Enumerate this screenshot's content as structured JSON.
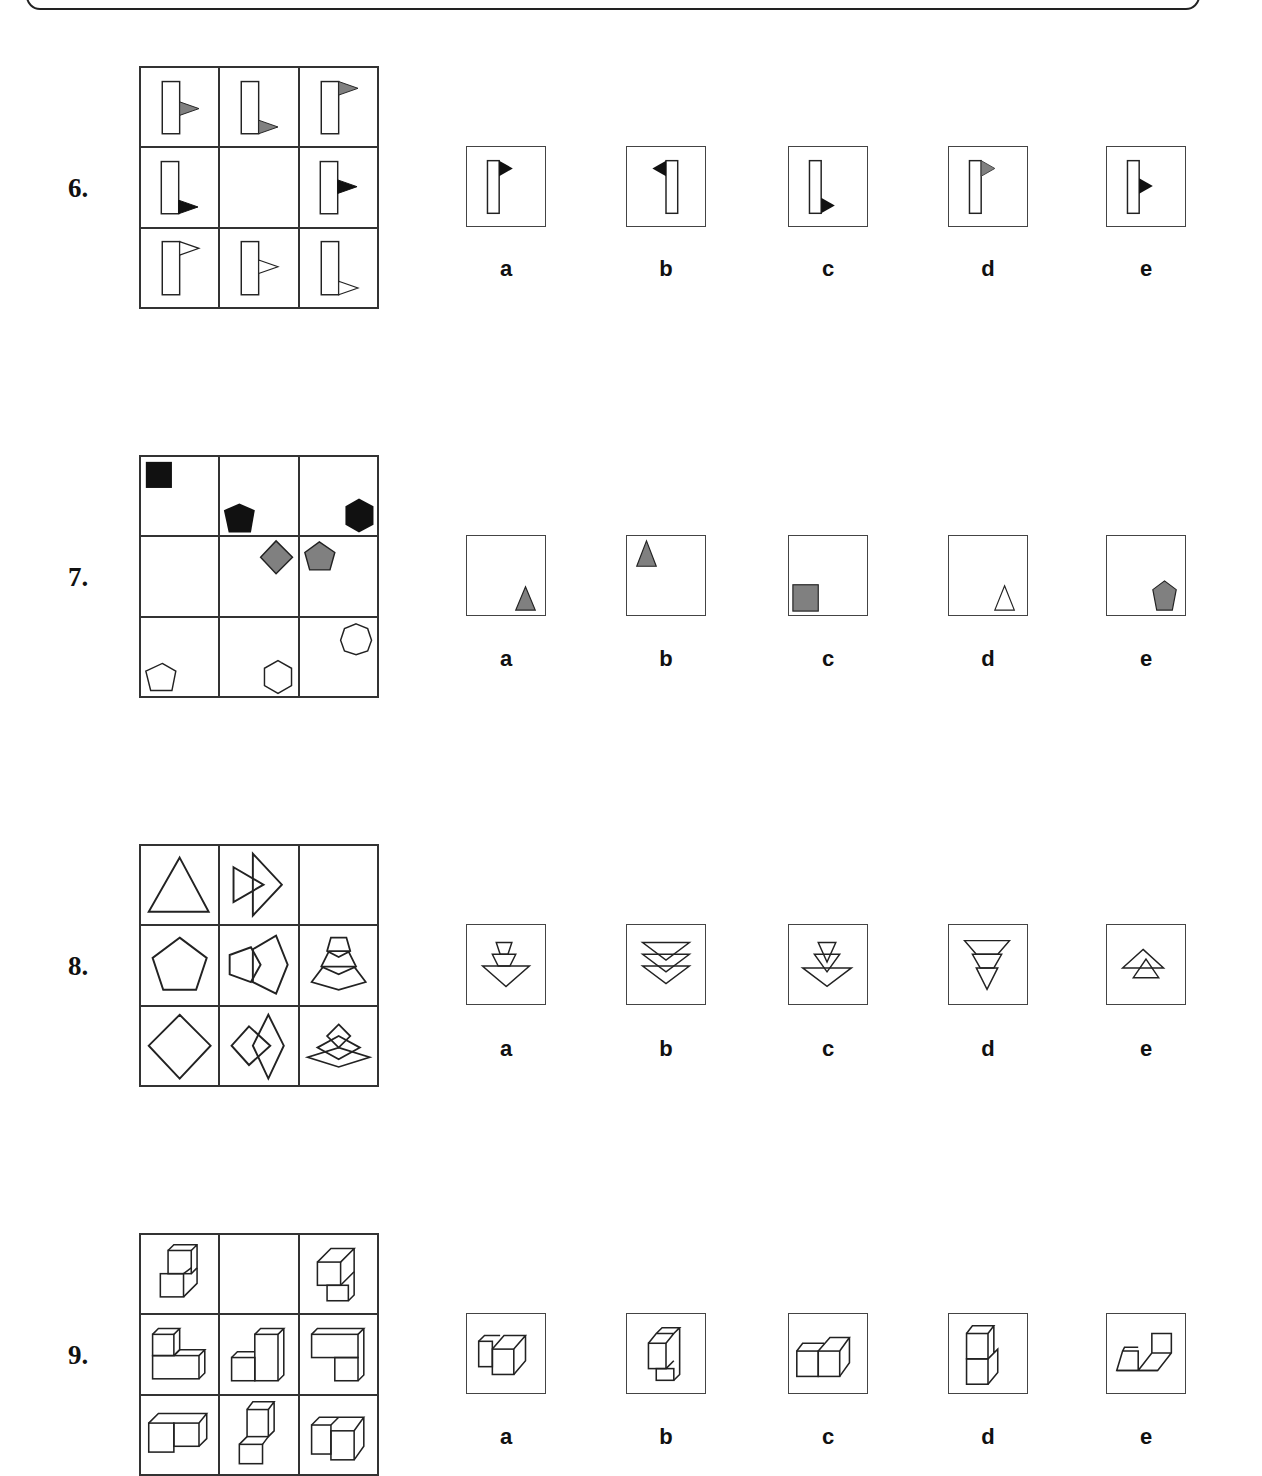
{
  "questions": [
    {
      "number": "6.",
      "grid": [
        "flag-gray-middle-right",
        "flag-gray-bottom-right",
        "flag-gray-top-right",
        "flag-black-bottom-right",
        "",
        "flag-black-middle-right",
        "flag-white-top-right",
        "flag-white-middle-right",
        "flag-white-bottom-right"
      ],
      "options": [
        {
          "label": "a",
          "figure": "flag-black-top-right"
        },
        {
          "label": "b",
          "figure": "flag-black-top-left"
        },
        {
          "label": "c",
          "figure": "flag-black-bottom-right"
        },
        {
          "label": "d",
          "figure": "flag-gray-top-right"
        },
        {
          "label": "e",
          "figure": "flag-black-middle-right"
        }
      ]
    },
    {
      "number": "7.",
      "grid": [
        "black-square-top-left",
        "black-pentagon-bottom-left",
        "black-hexagon-bottom-right",
        "",
        "gray-diamond-top-right",
        "gray-pentagon-top-left",
        "white-pentagon-bottom-left",
        "white-hexagon-bottom-right",
        "white-heptagon-top-right"
      ],
      "options": [
        {
          "label": "a",
          "figure": "gray-triangle-bottom-right"
        },
        {
          "label": "b",
          "figure": "gray-triangle-top-left"
        },
        {
          "label": "c",
          "figure": "gray-square-bottom-left"
        },
        {
          "label": "d",
          "figure": "white-triangle-bottom-right"
        },
        {
          "label": "e",
          "figure": "gray-pentagon-bottom-right"
        }
      ]
    },
    {
      "number": "8.",
      "grid": [
        "triangle",
        "two-triangles-overlapping",
        "",
        "pentagon",
        "two-pentagons-overlapping",
        "three-pentagons-stacked",
        "diamond",
        "two-diamonds-overlapping",
        "three-diamonds-stacked"
      ],
      "options": [
        {
          "label": "a",
          "figure": "three-down-triangles-growing"
        },
        {
          "label": "b",
          "figure": "three-down-triangles-equal"
        },
        {
          "label": "c",
          "figure": "three-down-triangles-nested"
        },
        {
          "label": "d",
          "figure": "three-down-triangles-shrinking"
        },
        {
          "label": "e",
          "figure": "two-up-triangles"
        }
      ]
    },
    {
      "number": "9.",
      "grid": [
        "cubes-stair-up",
        "",
        "cubes-overhang",
        "cubes-L-block",
        "cubes-step-tall",
        "cubes-T-block",
        "cubes-row-pair",
        "cubes-tower",
        "cubes-u-block"
      ],
      "options": [
        {
          "label": "a",
          "figure": "cubes-offset-pair"
        },
        {
          "label": "b",
          "figure": "cubes-vertical-offset"
        },
        {
          "label": "c",
          "figure": "cubes-side-by-side"
        },
        {
          "label": "d",
          "figure": "cubes-stacked"
        },
        {
          "label": "e",
          "figure": "cubes-open-step"
        }
      ]
    }
  ],
  "colors": {
    "black": "#111111",
    "gray": "#808080",
    "white": "#ffffff",
    "stroke": "#222222"
  }
}
